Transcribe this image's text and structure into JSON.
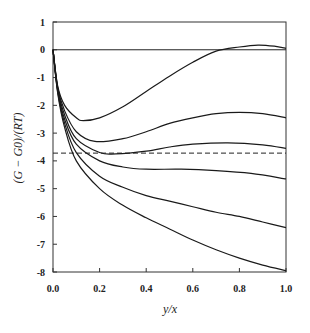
{
  "chart_data": {
    "type": "line",
    "title": "",
    "xlabel": "y/x",
    "ylabel": "(G − G0)/(RT)",
    "xlim": [
      0.0,
      1.0
    ],
    "ylim": [
      -8,
      1
    ],
    "xticks": [
      "0.0",
      "0.2",
      "0.4",
      "0.6",
      "0.8",
      "1.0"
    ],
    "yticks": [
      "1",
      "0",
      "-1",
      "-2",
      "-3",
      "-4",
      "-5",
      "-6",
      "-7",
      "-8"
    ],
    "grid": false,
    "legend": null,
    "reference_lines": [
      {
        "y": 0,
        "style": "solid"
      },
      {
        "y": -3.72,
        "style": "dashed"
      }
    ],
    "series": [
      {
        "name": "curve1",
        "x": [
          0,
          0.02,
          0.05,
          0.1,
          0.13,
          0.2,
          0.3,
          0.4,
          0.5,
          0.6,
          0.7,
          0.8,
          0.88,
          0.95,
          1.0
        ],
        "y": [
          0,
          -1.3,
          -2.0,
          -2.45,
          -2.55,
          -2.45,
          -2.05,
          -1.5,
          -0.95,
          -0.45,
          -0.05,
          0.1,
          0.17,
          0.13,
          0.05
        ]
      },
      {
        "name": "curve2",
        "x": [
          0,
          0.02,
          0.05,
          0.1,
          0.18,
          0.3,
          0.4,
          0.5,
          0.6,
          0.7,
          0.8,
          0.9,
          1.0
        ],
        "y": [
          0,
          -1.35,
          -2.2,
          -2.95,
          -3.3,
          -3.2,
          -2.95,
          -2.65,
          -2.45,
          -2.3,
          -2.25,
          -2.3,
          -2.45
        ]
      },
      {
        "name": "curve3",
        "x": [
          0,
          0.02,
          0.05,
          0.1,
          0.2,
          0.27,
          0.4,
          0.5,
          0.6,
          0.75,
          0.9,
          1.0
        ],
        "y": [
          0,
          -1.4,
          -2.35,
          -3.2,
          -3.7,
          -3.75,
          -3.65,
          -3.5,
          -3.4,
          -3.35,
          -3.42,
          -3.55
        ]
      },
      {
        "name": "curve4",
        "x": [
          0,
          0.02,
          0.05,
          0.1,
          0.2,
          0.3,
          0.4,
          0.55,
          0.7,
          0.85,
          1.0
        ],
        "y": [
          0,
          -1.45,
          -2.5,
          -3.4,
          -4.0,
          -4.22,
          -4.3,
          -4.3,
          -4.35,
          -4.45,
          -4.65
        ]
      },
      {
        "name": "curve5",
        "x": [
          0,
          0.02,
          0.05,
          0.1,
          0.2,
          0.3,
          0.4,
          0.5,
          0.6,
          0.7,
          0.8,
          0.9,
          1.0
        ],
        "y": [
          0,
          -1.5,
          -2.65,
          -3.7,
          -4.55,
          -4.95,
          -5.25,
          -5.45,
          -5.65,
          -5.85,
          -6.0,
          -6.2,
          -6.4
        ]
      },
      {
        "name": "curve6",
        "x": [
          0,
          0.02,
          0.05,
          0.1,
          0.2,
          0.3,
          0.4,
          0.5,
          0.6,
          0.7,
          0.8,
          0.9,
          1.0
        ],
        "y": [
          0,
          -1.55,
          -2.8,
          -4.0,
          -5.0,
          -5.6,
          -6.05,
          -6.45,
          -6.85,
          -7.2,
          -7.5,
          -7.75,
          -7.95
        ]
      }
    ]
  }
}
